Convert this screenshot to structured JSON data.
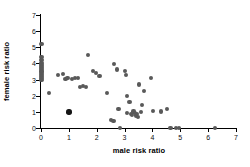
{
  "chart_data": {
    "type": "scatter",
    "title": "",
    "xlabel": "male risk ratio",
    "ylabel": "female risk ratio",
    "xlim": [
      0,
      7
    ],
    "ylim": [
      0,
      7
    ],
    "xticks": [
      0,
      1,
      2,
      3,
      4,
      5,
      6,
      7
    ],
    "yticks": [
      0,
      1,
      2,
      3,
      4,
      5,
      6,
      7
    ],
    "xticklabels": [
      "0",
      "1",
      "2",
      "3",
      "4",
      "5",
      "6",
      "7"
    ],
    "yticklabels": [
      "0",
      "1",
      "2",
      "3",
      "4",
      "5",
      "6",
      "7"
    ],
    "grid": false,
    "legend": null,
    "marker_color": "#595959",
    "emphasis_color": "#151515",
    "series": [
      {
        "name": "risk ratio pairs",
        "points": [
          {
            "x": 0.02,
            "y": 5.18
          },
          {
            "x": 0.02,
            "y": 4.38
          },
          {
            "x": 0.02,
            "y": 4.22
          },
          {
            "x": 0.02,
            "y": 4.05
          },
          {
            "x": 0.02,
            "y": 3.92
          },
          {
            "x": 0.02,
            "y": 3.8
          },
          {
            "x": 0.02,
            "y": 3.68
          },
          {
            "x": 0.02,
            "y": 3.55
          },
          {
            "x": 0.02,
            "y": 3.45
          },
          {
            "x": 0.02,
            "y": 3.32
          },
          {
            "x": 0.02,
            "y": 3.2
          },
          {
            "x": 0.02,
            "y": 3.08
          },
          {
            "x": 0.02,
            "y": 2.96
          },
          {
            "x": 0.3,
            "y": 2.18
          },
          {
            "x": 0.62,
            "y": 3.28
          },
          {
            "x": 0.8,
            "y": 3.32
          },
          {
            "x": 0.88,
            "y": 3.02
          },
          {
            "x": 0.95,
            "y": 3.12
          },
          {
            "x": 1.0,
            "y": 1.0,
            "emphasis": true
          },
          {
            "x": 1.12,
            "y": 3.05
          },
          {
            "x": 1.22,
            "y": 3.08
          },
          {
            "x": 1.32,
            "y": 3.08
          },
          {
            "x": 1.4,
            "y": 2.52
          },
          {
            "x": 1.52,
            "y": 2.58
          },
          {
            "x": 1.62,
            "y": 2.55
          },
          {
            "x": 1.7,
            "y": 4.5
          },
          {
            "x": 1.88,
            "y": 3.52
          },
          {
            "x": 1.98,
            "y": 3.4
          },
          {
            "x": 2.1,
            "y": 3.22
          },
          {
            "x": 2.38,
            "y": 2.15
          },
          {
            "x": 2.52,
            "y": 0.52
          },
          {
            "x": 2.6,
            "y": 0.45
          },
          {
            "x": 2.62,
            "y": 3.95
          },
          {
            "x": 2.72,
            "y": 3.62
          },
          {
            "x": 2.78,
            "y": 1.18
          },
          {
            "x": 2.85,
            "y": 0.02
          },
          {
            "x": 3.02,
            "y": 3.52
          },
          {
            "x": 3.05,
            "y": 3.3
          },
          {
            "x": 3.08,
            "y": 1.98
          },
          {
            "x": 3.1,
            "y": 0.92
          },
          {
            "x": 3.18,
            "y": 1.62
          },
          {
            "x": 3.22,
            "y": 0.88
          },
          {
            "x": 3.28,
            "y": 0.8
          },
          {
            "x": 3.32,
            "y": 1.02
          },
          {
            "x": 3.36,
            "y": 0.92
          },
          {
            "x": 3.4,
            "y": 0.78
          },
          {
            "x": 3.44,
            "y": 0.88
          },
          {
            "x": 3.48,
            "y": 0.7
          },
          {
            "x": 3.52,
            "y": 2.7
          },
          {
            "x": 3.58,
            "y": 0.98
          },
          {
            "x": 3.62,
            "y": 1.42
          },
          {
            "x": 3.7,
            "y": 2.3
          },
          {
            "x": 3.95,
            "y": 3.12
          },
          {
            "x": 4.02,
            "y": 1.05
          },
          {
            "x": 4.3,
            "y": 1.02
          },
          {
            "x": 4.52,
            "y": 1.18
          },
          {
            "x": 4.65,
            "y": 0.02
          },
          {
            "x": 4.85,
            "y": 0.02
          },
          {
            "x": 4.95,
            "y": 0.02
          },
          {
            "x": 6.25,
            "y": 0.02
          }
        ]
      }
    ]
  }
}
